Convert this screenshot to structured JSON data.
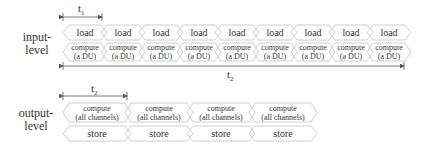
{
  "input_level": {
    "label_line1": "input-",
    "label_line2": "level",
    "interval_short": {
      "symbol": "t",
      "sub": "1"
    },
    "interval_long": {
      "symbol": "t",
      "sub": "2"
    },
    "row1": {
      "label": "load",
      "count": 9
    },
    "row2": {
      "label_line1": "compute",
      "label_line2": "(a DU)",
      "count": 9
    }
  },
  "output_level": {
    "label_line1": "output-",
    "label_line2": "level",
    "interval": {
      "symbol": "t",
      "sub": "2"
    },
    "row1": {
      "label_line1": "compute",
      "label_line2": "(all channels)",
      "count": 4
    },
    "row2": {
      "label": "store",
      "count": 4
    }
  },
  "colors": {
    "box_stroke": "#c8c8c8",
    "arrow": "#555555",
    "text": "#333333"
  }
}
